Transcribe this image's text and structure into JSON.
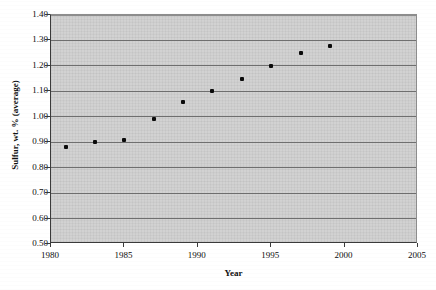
{
  "chart_data": {
    "type": "scatter",
    "title": "",
    "xlabel": "Year",
    "ylabel": "Sulfur, wt. % (average)",
    "xlim": [
      1980,
      2005
    ],
    "ylim": [
      0.5,
      1.4
    ],
    "grid": true,
    "legend": null,
    "x_ticks": [
      "1980",
      "1985",
      "1990",
      "1995",
      "2000",
      "2005"
    ],
    "x_tick_values": [
      1980,
      1985,
      1990,
      1995,
      2000,
      2005
    ],
    "y_ticks": [
      "0.50",
      "0.60",
      "0.70",
      "0.80",
      "0.90",
      "1.00",
      "1.10",
      "1.20",
      "1.30",
      "1.40"
    ],
    "y_tick_values": [
      0.5,
      0.6,
      0.7,
      0.8,
      0.9,
      1.0,
      1.1,
      1.2,
      1.3,
      1.4
    ],
    "x": [
      1981,
      1983,
      1985,
      1987,
      1989,
      1991,
      1993,
      1995,
      1997,
      1999
    ],
    "values": [
      0.88,
      0.9,
      0.91,
      0.99,
      1.06,
      1.1,
      1.15,
      1.2,
      1.25,
      1.28
    ],
    "points": [
      {
        "x": 1981,
        "y": 0.88
      },
      {
        "x": 1983,
        "y": 0.9
      },
      {
        "x": 1985,
        "y": 0.91
      },
      {
        "x": 1987,
        "y": 0.99
      },
      {
        "x": 1989,
        "y": 1.06
      },
      {
        "x": 1991,
        "y": 1.1
      },
      {
        "x": 1993,
        "y": 1.15
      },
      {
        "x": 1995,
        "y": 1.2
      },
      {
        "x": 1997,
        "y": 1.25
      },
      {
        "x": 1999,
        "y": 1.28
      }
    ],
    "marker_color": "#0a0a0a",
    "plot_background_color": "#d2d2d2",
    "gridline_color": "#6f6f6f",
    "axis_color": "#3a3a3a"
  }
}
